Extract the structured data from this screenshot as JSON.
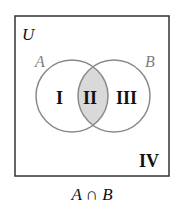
{
  "diagram": {
    "universe_label": "U",
    "set_a_label": "A",
    "set_b_label": "B",
    "regions": [
      "I",
      "II",
      "III",
      "IV"
    ],
    "shaded_region": "II",
    "caption": "A ∩ B",
    "colors": {
      "border": "#333333",
      "circle_stroke": "#8a8a8a",
      "shade": "#d9d9d9",
      "set_label": "#808080",
      "text": "#111111"
    }
  }
}
